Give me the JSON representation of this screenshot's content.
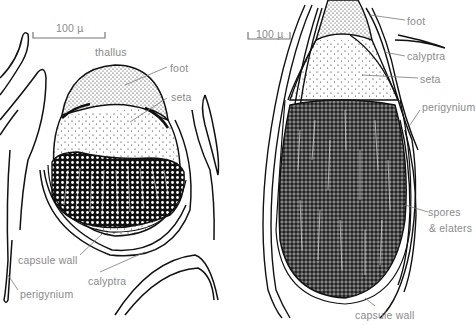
{
  "figure": {
    "left_panel": {
      "scale_bar": "100 µ",
      "labels": {
        "thallus": "thallus",
        "foot": "foot",
        "seta": "seta",
        "capsule_wall": "capsule wall",
        "calyptra": "calyptra",
        "perigynium": "perigynium"
      }
    },
    "right_panel": {
      "scale_bar": "100 µ",
      "labels": {
        "foot": "foot",
        "calyptra": "calyptra",
        "seta": "seta",
        "perigynium": "perigynium",
        "spores_line1": "spores",
        "spores_line2": "& elaters",
        "capsule_wall": "capsule wall"
      }
    },
    "colors": {
      "line": "#111111",
      "label": "#8a8a8a",
      "leader": "#777777"
    }
  }
}
